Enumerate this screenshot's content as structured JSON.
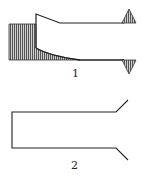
{
  "figures": [
    {
      "id": "1",
      "label": "1",
      "description": "End-loaded profile with hatched fill and upper/lower support triangles"
    },
    {
      "id": "2",
      "label": "2",
      "description": "Open rectangular profile with flared right ends"
    }
  ],
  "colors": {
    "stroke": "#222222",
    "hatch": "#666666",
    "triangle_fill": "#888888"
  }
}
